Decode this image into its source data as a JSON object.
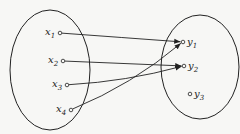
{
  "diagram": {
    "type": "set-mapping",
    "domain_set": {
      "ellipse": {
        "cx": 50,
        "cy": 70,
        "rx": 40,
        "ry": 60
      },
      "elements": [
        {
          "id": "x1",
          "label": "x",
          "sub": "1",
          "x": 60,
          "y": 33
        },
        {
          "id": "x2",
          "label": "x",
          "sub": "2",
          "x": 63,
          "y": 61
        },
        {
          "id": "x3",
          "label": "x",
          "sub": "3",
          "x": 67,
          "y": 85
        },
        {
          "id": "x4",
          "label": "x",
          "sub": "4",
          "x": 71,
          "y": 110
        }
      ]
    },
    "codomain_set": {
      "ellipse": {
        "cx": 200,
        "cy": 67,
        "rx": 39,
        "ry": 52
      },
      "elements": [
        {
          "id": "y1",
          "label": "y",
          "sub": "1",
          "x": 183,
          "y": 42
        },
        {
          "id": "y2",
          "label": "y",
          "sub": "2",
          "x": 184,
          "y": 66
        },
        {
          "id": "y3",
          "label": "y",
          "sub": "3",
          "x": 190,
          "y": 94
        }
      ]
    },
    "mappings": [
      {
        "from": "x1",
        "to": "y1",
        "curve": 0
      },
      {
        "from": "x2",
        "to": "y2",
        "curve": 0
      },
      {
        "from": "x3",
        "to": "y2",
        "curve": 6
      },
      {
        "from": "x4",
        "to": "y1",
        "curve": 10
      }
    ],
    "stroke_color": "#222222",
    "background": "#f7f7f5"
  }
}
